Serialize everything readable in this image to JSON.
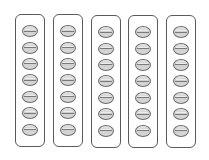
{
  "diagram": {
    "strip_count": 5,
    "beads_per_strip": 7,
    "colors": {
      "background": "#ffffff",
      "strip_border": "#5a5a5a",
      "bead_border": "#6a6a6a",
      "bead_fill": "#d4d4d4",
      "bead_line": "#7a7a7a"
    },
    "strips": [
      {
        "id": 1,
        "beads": 7
      },
      {
        "id": 2,
        "beads": 7
      },
      {
        "id": 3,
        "beads": 7
      },
      {
        "id": 4,
        "beads": 7
      },
      {
        "id": 5,
        "beads": 7
      }
    ]
  }
}
